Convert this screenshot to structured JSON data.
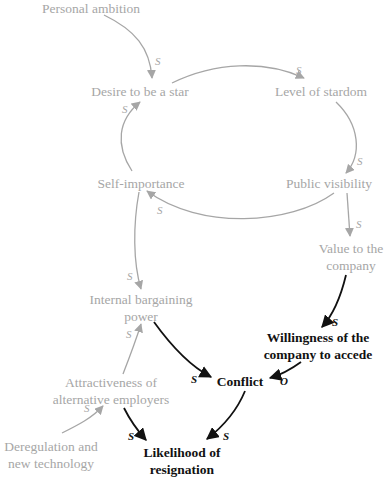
{
  "colors": {
    "faded": "#a6a6a6",
    "emphasis": "#111111",
    "background": "#ffffff"
  },
  "nodes": {
    "personal_ambition": "Personal ambition",
    "desire_to_be_star": "Desire to be a star",
    "level_of_stardom": "Level of stardom",
    "public_visibility": "Public visibility",
    "self_importance": "Self-importance",
    "value_to_company_1": "Value to the",
    "value_to_company_2": "company",
    "internal_bargaining_1": "Internal bargaining",
    "internal_bargaining_2": "power",
    "willingness_1": "Willingness of the",
    "willingness_2": "company to accede",
    "attractiveness_1": "Attractiveness of",
    "attractiveness_2": "alternative employers",
    "conflict": "Conflict",
    "deregulation_1": "Deregulation and",
    "deregulation_2": "new technology",
    "likelihood_1": "Likelihood of",
    "likelihood_2": "resignation"
  },
  "links": [
    {
      "from": "Personal ambition",
      "to": "Desire to be a star",
      "polarity": "s"
    },
    {
      "from": "Desire to be a star",
      "to": "Level of stardom",
      "polarity": "s"
    },
    {
      "from": "Level of stardom",
      "to": "Public visibility",
      "polarity": "s"
    },
    {
      "from": "Public visibility",
      "to": "Self-importance",
      "polarity": "s"
    },
    {
      "from": "Self-importance",
      "to": "Desire to be a star",
      "polarity": "s"
    },
    {
      "from": "Public visibility",
      "to": "Value to the company",
      "polarity": "s"
    },
    {
      "from": "Self-importance",
      "to": "Internal bargaining power",
      "polarity": "s"
    },
    {
      "from": "Value to the company",
      "to": "Willingness of the company to accede",
      "polarity": "s"
    },
    {
      "from": "Internal bargaining power",
      "to": "Conflict",
      "polarity": "s"
    },
    {
      "from": "Willingness of the company to accede",
      "to": "Conflict",
      "polarity": "o"
    },
    {
      "from": "Attractiveness of alternative employers",
      "to": "Internal bargaining power",
      "polarity": "s"
    },
    {
      "from": "Deregulation and new technology",
      "to": "Attractiveness of alternative employers",
      "polarity": "s"
    },
    {
      "from": "Attractiveness of alternative employers",
      "to": "Likelihood of resignation",
      "polarity": "s"
    },
    {
      "from": "Conflict",
      "to": "Likelihood of resignation",
      "polarity": "s"
    }
  ],
  "labels": {
    "s": "S",
    "o": "O"
  }
}
